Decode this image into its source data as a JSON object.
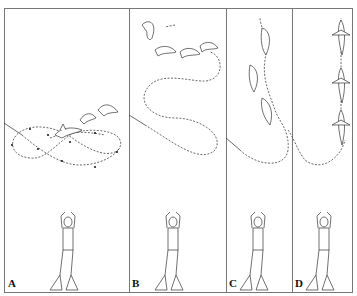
{
  "figure": {
    "type": "multi-panel illustration",
    "panels": [
      {
        "label": "A",
        "path": "figure-eight loop with two dolphins near center"
      },
      {
        "label": "B",
        "path": "S-curve path ending with three dolphins at top"
      },
      {
        "label": "C",
        "path": "curve leading upward with three dolphins in a vertical line"
      },
      {
        "label": "D",
        "path": "curve leading straight up with three dolphins seen from above"
      }
    ],
    "colors": {
      "line": "#333333",
      "border": "#777777",
      "background": "#ffffff"
    }
  }
}
